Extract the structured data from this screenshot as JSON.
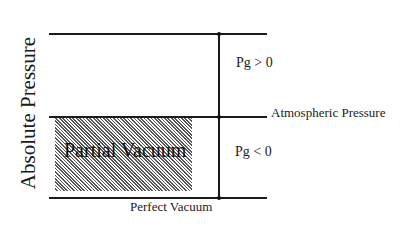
{
  "diagram": {
    "y_axis_label": "Absolute Pressure",
    "regions": {
      "partial_vacuum_label": "Partial Vacuum"
    },
    "levels": [
      {
        "name": "top",
        "label": ""
      },
      {
        "name": "atmospheric",
        "label": "Atmospheric Pressure"
      },
      {
        "name": "perfect_vacuum",
        "label": "Perfect Vacuum"
      }
    ],
    "gauge_labels": {
      "above": "Pg > 0",
      "below": "Pg < 0"
    },
    "colors": {
      "line": "#1a1a1a",
      "background": "#ffffff",
      "hatch": "#3a3a3a"
    }
  }
}
